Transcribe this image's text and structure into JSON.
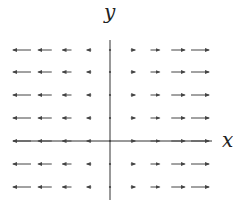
{
  "diagram": {
    "type": "vector-field",
    "field": "F(x,y) = (x, 0)",
    "axes": {
      "x_label": "x",
      "y_label": "y",
      "origin_px": [
        110,
        141
      ],
      "x_axis_px": [
        13,
        212
      ],
      "y_axis_px": [
        40,
        200
      ]
    },
    "grid": {
      "columns_px": [
        22,
        45,
        67,
        89,
        110,
        133,
        155,
        178,
        200
      ],
      "column_x_values": [
        -4,
        -3,
        -2,
        -1,
        0,
        1,
        2,
        3,
        4
      ],
      "rows_px": [
        50,
        72,
        95,
        118,
        141,
        164,
        187
      ],
      "row_y_values": [
        4,
        3,
        2,
        1,
        0,
        -1,
        -2
      ]
    },
    "arrow_length_per_unit_px": 4.5,
    "colors": {
      "axis": "#333333",
      "arrow": "#444444",
      "background": "#ffffff"
    }
  }
}
